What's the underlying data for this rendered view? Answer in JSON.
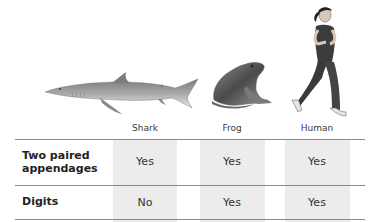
{
  "organisms": [
    {
      "name": "Shark",
      "icon": "shark-illustration"
    },
    {
      "name": "Frog",
      "icon": "frog-illustration"
    },
    {
      "name": "Human",
      "icon": "human-runner-illustration"
    }
  ],
  "table": {
    "columns": [
      "Shark",
      "Frog",
      "Human"
    ],
    "rows": [
      {
        "label": "Two paired appendages",
        "label_line1": "Two paired",
        "label_line2": "appendages",
        "values": [
          "Yes",
          "Yes",
          "Yes"
        ]
      },
      {
        "label": "Digits",
        "values": [
          "No",
          "Yes",
          "Yes"
        ]
      }
    ]
  },
  "colors": {
    "column_shade": "#ececec",
    "rule": "#8a8a8a",
    "text": "#2a2a2a"
  }
}
